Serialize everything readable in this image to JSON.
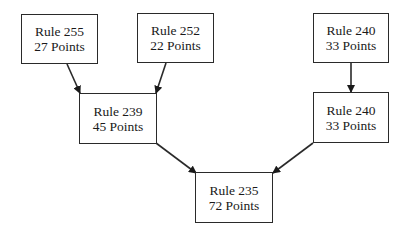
{
  "diagram": {
    "type": "tree",
    "direction": "bottom-up-merge",
    "nodes": [
      {
        "id": "r255",
        "rule": "Rule 255",
        "points": "27 Points",
        "x": 21,
        "y": 14,
        "w": 77,
        "h": 50
      },
      {
        "id": "r252",
        "rule": "Rule 252",
        "points": "22 Points",
        "x": 137,
        "y": 13,
        "w": 77,
        "h": 50
      },
      {
        "id": "r240a",
        "rule": "Rule 240",
        "points": "33 Points",
        "x": 313,
        "y": 13,
        "w": 76,
        "h": 50
      },
      {
        "id": "r239",
        "rule": "Rule 239",
        "points": "45 Points",
        "x": 79,
        "y": 93,
        "w": 78,
        "h": 51
      },
      {
        "id": "r240b",
        "rule": "Rule 240",
        "points": "33 Points",
        "x": 313,
        "y": 92,
        "w": 76,
        "h": 51
      },
      {
        "id": "r235",
        "rule": "Rule 235",
        "points": "72 Points",
        "x": 195,
        "y": 172,
        "w": 78,
        "h": 51
      }
    ],
    "edges": [
      {
        "from": "r255",
        "to": "r239",
        "x1": 67,
        "y1": 64,
        "x2": 80,
        "y2": 93
      },
      {
        "from": "r252",
        "to": "r239",
        "x1": 166,
        "y1": 63,
        "x2": 156,
        "y2": 93
      },
      {
        "from": "r240a",
        "to": "r240b",
        "x1": 351,
        "y1": 63,
        "x2": 351,
        "y2": 92
      },
      {
        "from": "r239",
        "to": "r235",
        "x1": 156,
        "y1": 143,
        "x2": 196,
        "y2": 173
      },
      {
        "from": "r240b",
        "to": "r235",
        "x1": 313,
        "y1": 143,
        "x2": 273,
        "y2": 173
      }
    ],
    "colors": {
      "stroke": "#2a2a2a",
      "background": "#ffffff",
      "text": "#1a1a1a"
    }
  }
}
